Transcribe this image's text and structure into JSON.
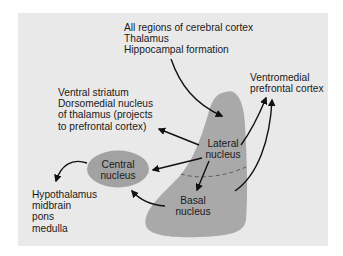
{
  "figure": {
    "colors": {
      "panel_bg": "#e9e9e9",
      "amygdala_fill": "#a9a9a9",
      "central_fill": "#a2a2a2",
      "arrow": "#111111",
      "text": "#1a1a1a"
    }
  },
  "nodes": {
    "lateral": {
      "line1": "Lateral",
      "line2": "nucleus"
    },
    "basal": {
      "line1": "Basal",
      "line2": "nucleus"
    },
    "central": {
      "line1": "Central",
      "line2": "nucleus"
    }
  },
  "labels": {
    "cortical_inputs": {
      "lines": [
        "All regions of cerebral cortex",
        "Thalamus",
        "Hippocampal formation"
      ]
    },
    "ventral_striatum": {
      "lines": [
        "Ventral striatum",
        "Dorsomedial nucleus",
        "of thalamus (projects",
        "to prefrontal cortex)"
      ]
    },
    "vmpfc": {
      "lines": [
        "Ventromedial",
        "prefrontal cortex"
      ]
    },
    "brainstem_targets": {
      "lines": [
        "Hypothalamus",
        "midbrain",
        "pons",
        "medulla"
      ]
    }
  },
  "connections": [
    {
      "from": "cortical_inputs",
      "to": "lateral"
    },
    {
      "from": "lateral",
      "to": "ventral_striatum"
    },
    {
      "from": "lateral",
      "to": "central"
    },
    {
      "from": "lateral",
      "to": "basal"
    },
    {
      "from": "lateral",
      "to": "vmpfc"
    },
    {
      "from": "basal",
      "to": "vmpfc"
    },
    {
      "from": "basal",
      "to": "central"
    },
    {
      "from": "central",
      "to": "brainstem_targets"
    }
  ]
}
